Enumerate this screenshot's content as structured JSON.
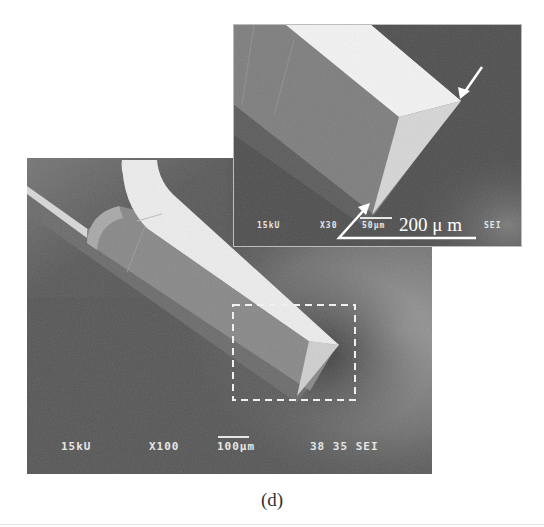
{
  "figure": {
    "caption": "(d)",
    "main_image": {
      "description": "SEM micrograph of probe tip",
      "labels": {
        "voltage": "15kU",
        "magnification": "X100",
        "scale_bar": "100μm",
        "id": "38 35 SEI"
      },
      "highlight_box": "dashed region enlarged in inset"
    },
    "inset_image": {
      "description": "Enlarged SEM view of dashed region",
      "labels": {
        "voltage": "15kU",
        "magnification": "X30",
        "scale_bar": "50μm",
        "mode": "SEI"
      },
      "overlay_annotation": "200 μ m",
      "arrows": [
        "arrow-top-right",
        "arrow-bottom-left"
      ]
    }
  },
  "colors": {
    "background": "#ffffff",
    "sem_label": "#e6e6e6",
    "annotation": "#ffffff"
  }
}
